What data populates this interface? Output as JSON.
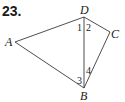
{
  "problem_number": "23.",
  "vertices": {
    "A": {
      "label": "A",
      "x": 15,
      "y": 42
    },
    "B": {
      "label": "B",
      "x": 84,
      "y": 88
    },
    "C": {
      "label": "C",
      "x": 110,
      "y": 33
    },
    "D": {
      "label": "D",
      "x": 84,
      "y": 17
    }
  },
  "angles": {
    "a1": "1",
    "a2": "2",
    "a3": "3",
    "a4": "4"
  },
  "colors": {
    "stroke": "#3a3a3a",
    "text": "#222222"
  }
}
